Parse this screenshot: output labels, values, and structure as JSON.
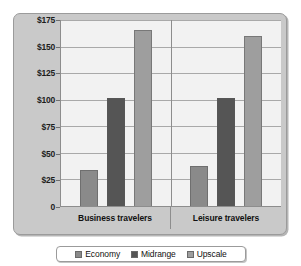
{
  "chart_data": {
    "type": "bar",
    "title": "",
    "xlabel": "",
    "ylabel": "",
    "categories": [
      "Business travelers",
      "Leisure travelers"
    ],
    "series": [
      {
        "name": "Economy",
        "color": "#8a8a8a",
        "values": [
          34,
          38
        ]
      },
      {
        "name": "Midrange",
        "color": "#555555",
        "values": [
          102,
          102
        ]
      },
      {
        "name": "Upscale",
        "color": "#9e9e9e",
        "values": [
          166,
          160
        ]
      }
    ],
    "ylim": [
      0,
      175
    ],
    "ytick_values": [
      0,
      25,
      50,
      75,
      100,
      125,
      150,
      175
    ],
    "ytick_labels": [
      "0",
      "$25",
      "$50",
      "$75",
      "$100",
      "$125",
      "$150",
      "$175"
    ],
    "grid": true,
    "legend_position": "bottom",
    "value_prefix": "$"
  },
  "legend": {
    "items": [
      {
        "label": "Economy",
        "color": "#8a8a8a"
      },
      {
        "label": "Midrange",
        "color": "#555555"
      },
      {
        "label": "Upscale",
        "color": "#9e9e9e"
      }
    ]
  },
  "colors": {
    "panel_background": "#c9c9c9",
    "plot_background": "#f2f2f2",
    "gridline": "#a9a9a9",
    "axis": "#8d8d8d",
    "text": "#111111"
  }
}
